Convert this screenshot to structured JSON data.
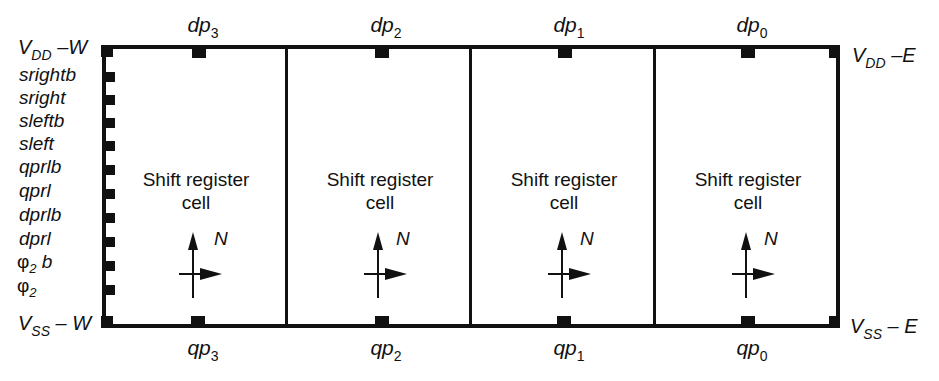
{
  "diagram": {
    "frame": {
      "left": 102,
      "right": 838,
      "top": 47,
      "bottom": 326,
      "stroke": "#111111"
    },
    "rails": {
      "top_left": {
        "main": "V",
        "sub": "DD",
        "suffix": " –W"
      },
      "bottom_left": {
        "main": "V",
        "sub": "SS",
        "suffix": " – W"
      },
      "top_right": {
        "main": "V",
        "sub": "DD",
        "suffix": " –E"
      },
      "bottom_right": {
        "main": "V",
        "sub": "SS",
        "suffix": " – E"
      }
    },
    "left_signals": [
      {
        "label": "srightb",
        "sub": ""
      },
      {
        "label": "sright",
        "sub": ""
      },
      {
        "label": "sleftb",
        "sub": ""
      },
      {
        "label": "sleft",
        "sub": ""
      },
      {
        "label": "qprlb",
        "sub": ""
      },
      {
        "label": "qprl",
        "sub": ""
      },
      {
        "label": "dprlb",
        "sub": ""
      },
      {
        "label": "dprl",
        "sub": ""
      },
      {
        "label": "φ",
        "sub": "2",
        "suffix": " b"
      },
      {
        "label": "φ",
        "sub": "2",
        "suffix": ""
      }
    ],
    "cells": [
      {
        "line1": "Shift register",
        "line2": "cell",
        "compass_label": "N",
        "top_port": {
          "main": "dp",
          "sub": "3"
        },
        "bottom_port": {
          "main": "qp",
          "sub": "3"
        }
      },
      {
        "line1": "Shift register",
        "line2": "cell",
        "compass_label": "N",
        "top_port": {
          "main": "dp",
          "sub": "2"
        },
        "bottom_port": {
          "main": "qp",
          "sub": "2"
        }
      },
      {
        "line1": "Shift register",
        "line2": "cell",
        "compass_label": "N",
        "top_port": {
          "main": "dp",
          "sub": "1"
        },
        "bottom_port": {
          "main": "qp",
          "sub": "1"
        }
      },
      {
        "line1": "Shift register",
        "line2": "cell",
        "compass_label": "N",
        "top_port": {
          "main": "dp",
          "sub": "0"
        },
        "bottom_port": {
          "main": "qp",
          "sub": "0"
        }
      }
    ]
  }
}
